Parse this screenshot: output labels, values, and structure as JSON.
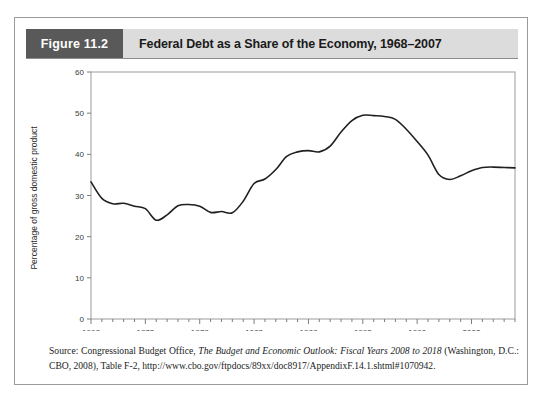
{
  "figure": {
    "number_label": "Figure 11.2",
    "title": "Federal Debt as a Share of the Economy, 1968–2007"
  },
  "source_note": {
    "prefix": "Source: Congressional Budget Office, ",
    "italic_title": "The Budget and Economic Outlook: Fiscal Years 2008 to 2018",
    "suffix": " (Washington, D.C.: CBO, 2008), Table F-2, http://www.cbo.gov/ftpdocs/89xx/doc8917/AppendixF.14.1.shtml#1070942."
  },
  "colors": {
    "header_number_bg": "#595959",
    "header_title_bg": "#dcdcdc",
    "frame_border": "#9a9a9a",
    "line": "#231f20",
    "axis": "#7d7d7d"
  },
  "chart_data": {
    "type": "line",
    "title": "Federal Debt as a Share of the Economy, 1968–2007",
    "xlabel": "",
    "ylabel": "Percentage of gross domestic product",
    "xlim": [
      1968,
      2007
    ],
    "ylim": [
      0,
      60
    ],
    "ytick_step": 10,
    "yticks": [
      0,
      10,
      20,
      30,
      40,
      50,
      60
    ],
    "xticks_labeled": [
      1968,
      1973,
      1978,
      1983,
      1988,
      1993,
      1998,
      2003
    ],
    "xtick_step_minor": 1,
    "grid": false,
    "legend": false,
    "series": [
      {
        "name": "Federal debt held by the public as a percentage of GDP",
        "x": [
          1968,
          1969,
          1970,
          1971,
          1972,
          1973,
          1974,
          1975,
          1976,
          1977,
          1978,
          1979,
          1980,
          1981,
          1982,
          1983,
          1984,
          1985,
          1986,
          1987,
          1988,
          1989,
          1990,
          1991,
          1992,
          1993,
          1994,
          1995,
          1996,
          1997,
          1998,
          1999,
          2000,
          2001,
          2002,
          2003,
          2004,
          2005,
          2006,
          2007
        ],
        "values": [
          33.3,
          29.3,
          28.0,
          28.1,
          27.4,
          26.8,
          24.0,
          25.3,
          27.5,
          27.8,
          27.4,
          25.9,
          26.1,
          25.8,
          28.6,
          32.9,
          34.0,
          36.3,
          39.5,
          40.6,
          40.9,
          40.6,
          42.0,
          45.4,
          48.2,
          49.5,
          49.4,
          49.2,
          48.5,
          46.1,
          43.1,
          39.8,
          35.1,
          33.9,
          34.8,
          36.0,
          36.8,
          36.9,
          36.8,
          36.7
        ]
      }
    ]
  }
}
